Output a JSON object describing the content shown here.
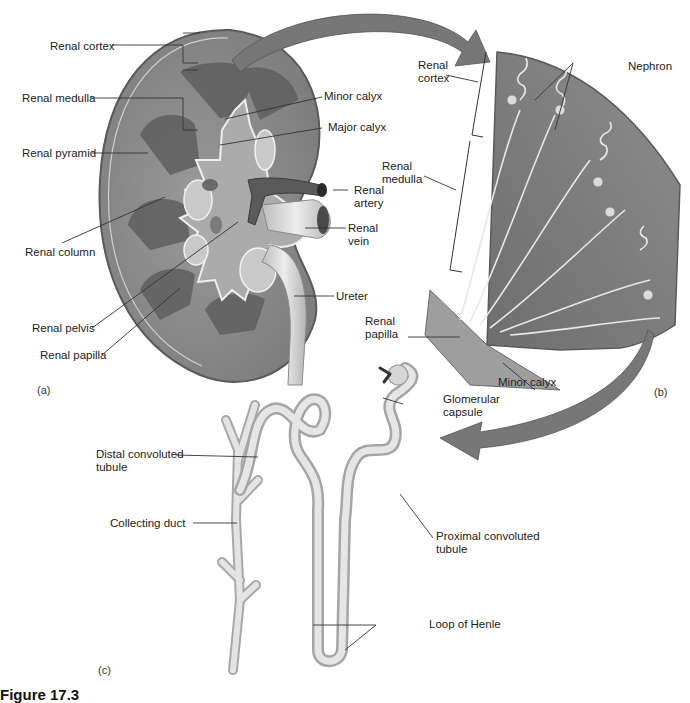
{
  "figure": {
    "caption_partial": "Figure 17.3",
    "panels": [
      {
        "id": "a",
        "label": "(a)",
        "title": "Kidney cross section"
      },
      {
        "id": "b",
        "label": "(b)",
        "title": "Renal pyramid detail"
      },
      {
        "id": "c",
        "label": "(c)",
        "title": "Nephron"
      }
    ]
  },
  "panel_a": {
    "labels": {
      "renal_cortex": "Renal cortex",
      "renal_medulla": "Renal medulla",
      "renal_pyramid": "Renal pyramid",
      "renal_column": "Renal column",
      "renal_pelvis": "Renal pelvis",
      "renal_papilla": "Renal papilla",
      "minor_calyx": "Minor calyx",
      "major_calyx": "Major calyx",
      "renal_artery": "Renal\nartery",
      "renal_vein": "Renal\nvein",
      "ureter": "Ureter"
    }
  },
  "panel_b": {
    "labels": {
      "renal_cortex": "Renal\ncortex",
      "renal_medulla": "Renal\nmedulla",
      "nephron": "Nephron",
      "renal_papilla": "Renal\npapilla",
      "minor_calyx": "Minor calyx"
    }
  },
  "panel_c": {
    "labels": {
      "glomerular_capsule": "Glomerular\ncapsule",
      "distal_convoluted_tubule": "Distal convoluted\ntubule",
      "collecting_duct": "Collecting duct",
      "proximal_convoluted_tubule": "Proximal convoluted\ntubule",
      "loop_of_henle": "Loop of Henle"
    }
  },
  "colors": {
    "cortex": "#8e8e8e",
    "medulla": "#6a6a6a",
    "pelvis": "#a9a9a9",
    "arrow": "#7a7a7a",
    "tubule": "#d2d2d2",
    "leader_line": "#333333"
  }
}
